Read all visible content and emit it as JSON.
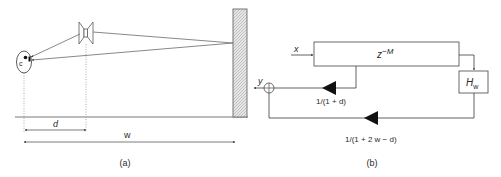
{
  "colors": {
    "line": "#6a6a6a",
    "dark_line": "#3a3a3a",
    "text": "#2a2a2a",
    "fill_black": "#111111",
    "wall_hatch": "#bdbdbd",
    "background": "#ffffff"
  },
  "panel_a": {
    "caption": "(a)",
    "listener": {
      "label": "c",
      "icon": "head-icon"
    },
    "speaker": {
      "icon": "loudspeaker-icon"
    },
    "wall": {
      "icon": "hatched-wall-icon"
    },
    "dimension_d": {
      "label": "d"
    },
    "dimension_w": {
      "label": "w"
    }
  },
  "panel_b": {
    "caption": "(b)",
    "input_label": "x",
    "output_label": "y",
    "delay_block": {
      "base": "z",
      "exponent": "−M"
    },
    "filter_block": {
      "base": "H",
      "subscript": "w"
    },
    "direct_gain": {
      "label": "1/(1 + d)"
    },
    "reflected_gain": {
      "label": "1/(1 + 2 w − d)"
    },
    "summer": {
      "icon": "summing-junction-icon"
    }
  }
}
